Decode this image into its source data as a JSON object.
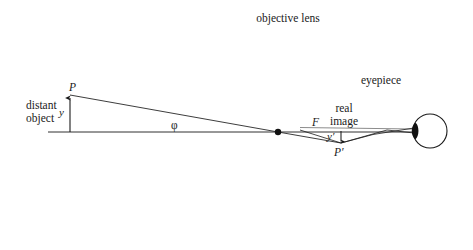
{
  "figure": {
    "background_color": "#ffffff",
    "ink_color": "#1a1a1a",
    "lens_fill_color": "#8a8a8a"
  },
  "labels": {
    "objective_lens": "objective lens",
    "eyepiece": "eyepiece",
    "distant": "distant",
    "object": "object",
    "point_P": "P",
    "object_height_y": "y",
    "angle_phi": "φ",
    "focal_point_F": "F",
    "real": "real",
    "image": "image",
    "image_height_y_prime": "y′",
    "point_P_prime": "P′"
  },
  "geometry": {
    "axis": {
      "x1": 48,
      "y1": 132,
      "x2": 416,
      "y2": 132
    },
    "object_arrow": {
      "x": 70,
      "y_base": 132,
      "y_tip": 96
    },
    "objective_lens": {
      "center_x": 278,
      "top_y": 30,
      "bottom_y": 245,
      "half_width": 22
    },
    "objective_center_dot": {
      "x": 278,
      "y": 132,
      "r": 3.2
    },
    "eyepiece_lens": {
      "center_x": 380,
      "top_y": 92,
      "bottom_y": 172,
      "half_width": 7
    },
    "eye": {
      "center_x": 430,
      "center_y": 131,
      "radius": 17
    },
    "eye_pupil": {
      "center_x": 414,
      "center_y": 131,
      "rx": 4,
      "ry": 8
    },
    "image_point_P_prime": {
      "x": 341,
      "y": 143
    },
    "focal_point_F": {
      "x": 318,
      "y": 132
    }
  },
  "label_positions": {
    "objective_lens": {
      "x": 288,
      "y": 12
    },
    "eyepiece": {
      "x": 381,
      "y": 74
    },
    "distant": {
      "x": 26,
      "y": 99
    },
    "object": {
      "x": 26,
      "y": 112
    },
    "point_P": {
      "x": 69,
      "y": 81
    },
    "object_height_y": {
      "x": 59,
      "y": 107
    },
    "angle_phi": {
      "x": 171,
      "y": 119
    },
    "focal_point_F": {
      "x": 312,
      "y": 116
    },
    "real": {
      "x": 344,
      "y": 102
    },
    "image": {
      "x": 340,
      "y": 115
    },
    "image_height_y_prime": {
      "x": 327,
      "y": 131
    },
    "point_P_prime": {
      "x": 334,
      "y": 146
    }
  }
}
